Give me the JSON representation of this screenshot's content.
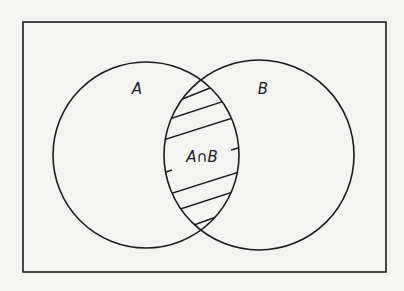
{
  "diagram": {
    "type": "venn",
    "universe": {
      "x": 23,
      "y": 22,
      "width": 363,
      "height": 250
    },
    "sets": [
      {
        "name": "A",
        "label": "A",
        "cx": 146,
        "cy": 155,
        "r": 93,
        "label_x": 137,
        "label_y": 94
      },
      {
        "name": "B",
        "label": "B",
        "cx": 259,
        "cy": 155,
        "r": 95,
        "label_x": 263,
        "label_y": 94
      }
    ],
    "intersection": {
      "label": "A∩B",
      "label_x": 202,
      "label_y": 162,
      "shading": "hatched"
    },
    "colors": {
      "stroke": "#1c1c1c",
      "background": "#f3f3f1"
    }
  }
}
